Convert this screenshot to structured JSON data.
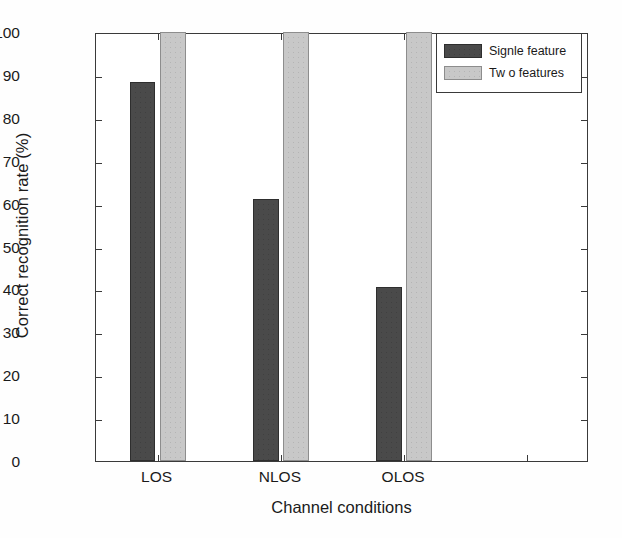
{
  "chart_data": {
    "type": "bar",
    "title": "",
    "xlabel": "Channel conditions",
    "ylabel": "Correct recognition rate (%)",
    "categories": [
      "LOS",
      "NLOS",
      "OLOS"
    ],
    "series": [
      {
        "name": "Signle feature",
        "values": [
          88.4,
          61.0,
          40.5
        ],
        "color": "#4a4a4a"
      },
      {
        "name": "Tw o features",
        "values": [
          100,
          100,
          100
        ],
        "color": "#c8c8c8"
      }
    ],
    "ylim": [
      0,
      100
    ],
    "ytick_labels": [
      "0",
      "10",
      "20",
      "30",
      "40",
      "50",
      "60",
      "70",
      "80",
      "90",
      "100"
    ],
    "ytick_values": [
      0,
      10,
      20,
      30,
      40,
      50,
      60,
      70,
      80,
      90,
      100
    ],
    "grid": false,
    "legend_position": "top-right",
    "empty_trailing_category_slot": true
  },
  "legend": {
    "items": [
      {
        "label": "Signle feature",
        "swatch": "#4a4a4a"
      },
      {
        "label": "Tw o features",
        "swatch": "#c8c8c8"
      }
    ]
  },
  "axes": {
    "x_title": "Channel conditions",
    "y_title": "Correct recognition rate (%)"
  }
}
